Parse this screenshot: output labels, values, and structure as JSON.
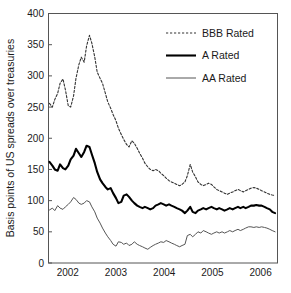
{
  "chart_data": {
    "type": "line",
    "title": "",
    "xlabel": "",
    "ylabel": "Basis points of US spreads over treasuries",
    "xlim": [
      2001.6,
      2006.35
    ],
    "ylim": [
      0,
      400
    ],
    "grid": false,
    "legend_position": "top-right",
    "xticks": [
      "2002",
      "2003",
      "2004",
      "2005",
      "2006"
    ],
    "xtick_values": [
      2002,
      2003,
      2004,
      2005,
      2006
    ],
    "yticks": [
      "0",
      "50",
      "100",
      "150",
      "200",
      "250",
      "300",
      "350",
      "400"
    ],
    "ytick_values": [
      0,
      50,
      100,
      150,
      200,
      250,
      300,
      350,
      400
    ],
    "x": [
      2001.62,
      2001.68,
      2001.73,
      2001.79,
      2001.84,
      2001.9,
      2001.95,
      2002.01,
      2002.06,
      2002.12,
      2002.17,
      2002.23,
      2002.28,
      2002.34,
      2002.39,
      2002.45,
      2002.5,
      2002.56,
      2002.61,
      2002.67,
      2002.72,
      2002.78,
      2002.83,
      2002.89,
      2002.94,
      2003.0,
      2003.05,
      2003.11,
      2003.16,
      2003.22,
      2003.27,
      2003.33,
      2003.38,
      2003.44,
      2003.49,
      2003.55,
      2003.6,
      2003.66,
      2003.71,
      2003.77,
      2003.82,
      2003.88,
      2003.93,
      2003.99,
      2004.04,
      2004.1,
      2004.15,
      2004.21,
      2004.26,
      2004.32,
      2004.37,
      2004.43,
      2004.48,
      2004.54,
      2004.59,
      2004.65,
      2004.7,
      2004.76,
      2004.81,
      2004.87,
      2004.92,
      2004.98,
      2005.03,
      2005.09,
      2005.14,
      2005.2,
      2005.25,
      2005.31,
      2005.36,
      2005.42,
      2005.47,
      2005.53,
      2005.58,
      2005.64,
      2005.69,
      2005.75,
      2005.8,
      2005.86,
      2005.91,
      2005.97,
      2006.02,
      2006.08,
      2006.13,
      2006.19,
      2006.24,
      2006.3
    ],
    "series": [
      {
        "name": "BBB Rated",
        "style": "dotted",
        "color": "#333333",
        "width": 1.1,
        "values": [
          256,
          250,
          262,
          272,
          288,
          295,
          278,
          252,
          250,
          268,
          296,
          318,
          330,
          322,
          348,
          365,
          352,
          330,
          306,
          296,
          288,
          272,
          258,
          248,
          238,
          228,
          216,
          206,
          198,
          190,
          186,
          196,
          192,
          184,
          176,
          168,
          160,
          154,
          150,
          148,
          150,
          148,
          144,
          140,
          136,
          132,
          130,
          128,
          126,
          124,
          126,
          130,
          140,
          158,
          146,
          138,
          130,
          126,
          124,
          126,
          128,
          126,
          122,
          118,
          116,
          114,
          112,
          110,
          112,
          114,
          116,
          118,
          116,
          114,
          116,
          118,
          120,
          121,
          120,
          118,
          116,
          114,
          112,
          110,
          109,
          108
        ]
      },
      {
        "name": "A Rated",
        "style": "solid",
        "color": "#000000",
        "width": 2.1,
        "values": [
          162,
          156,
          150,
          148,
          158,
          152,
          150,
          156,
          166,
          172,
          183,
          176,
          170,
          178,
          188,
          186,
          174,
          160,
          146,
          134,
          128,
          122,
          118,
          120,
          112,
          104,
          96,
          98,
          108,
          110,
          106,
          100,
          96,
          92,
          90,
          88,
          90,
          88,
          86,
          88,
          92,
          94,
          96,
          94,
          92,
          94,
          92,
          90,
          88,
          86,
          84,
          80,
          84,
          90,
          82,
          80,
          84,
          86,
          88,
          86,
          88,
          90,
          88,
          86,
          88,
          86,
          84,
          86,
          88,
          86,
          88,
          90,
          88,
          90,
          88,
          90,
          92,
          92,
          93,
          92,
          92,
          90,
          88,
          86,
          82,
          80
        ]
      },
      {
        "name": "AA Rated",
        "style": "solid",
        "color": "#555555",
        "width": 1.0,
        "values": [
          85,
          88,
          84,
          92,
          88,
          86,
          90,
          94,
          98,
          105,
          102,
          96,
          94,
          96,
          100,
          98,
          90,
          82,
          72,
          64,
          56,
          48,
          42,
          36,
          30,
          27,
          34,
          33,
          30,
          32,
          28,
          30,
          34,
          30,
          28,
          26,
          24,
          22,
          25,
          28,
          30,
          32,
          34,
          33,
          36,
          34,
          32,
          30,
          28,
          26,
          28,
          30,
          44,
          46,
          42,
          46,
          50,
          48,
          52,
          50,
          48,
          46,
          48,
          50,
          48,
          50,
          48,
          50,
          52,
          50,
          52,
          54,
          52,
          54,
          56,
          58,
          58,
          57,
          58,
          57,
          58,
          57,
          56,
          54,
          52,
          50
        ]
      }
    ]
  },
  "legend": {
    "items": [
      {
        "label": "BBB Rated",
        "style": "dotted"
      },
      {
        "label": "A Rated",
        "style": "solid-thick"
      },
      {
        "label": "AA Rated",
        "style": "solid-thin"
      }
    ]
  },
  "axes": {
    "y_label": "Basis points of US spreads over treasuries",
    "y_ticks": [
      "400",
      "350",
      "300",
      "250",
      "200",
      "150",
      "100",
      "50",
      "0"
    ],
    "x_ticks": [
      "2002",
      "2003",
      "2004",
      "2005",
      "2006"
    ]
  },
  "colors": {
    "frame": "#555555",
    "text": "#1a1a1a",
    "bbb": "#333333",
    "a": "#000000",
    "aa": "#555555",
    "background": "#ffffff"
  }
}
